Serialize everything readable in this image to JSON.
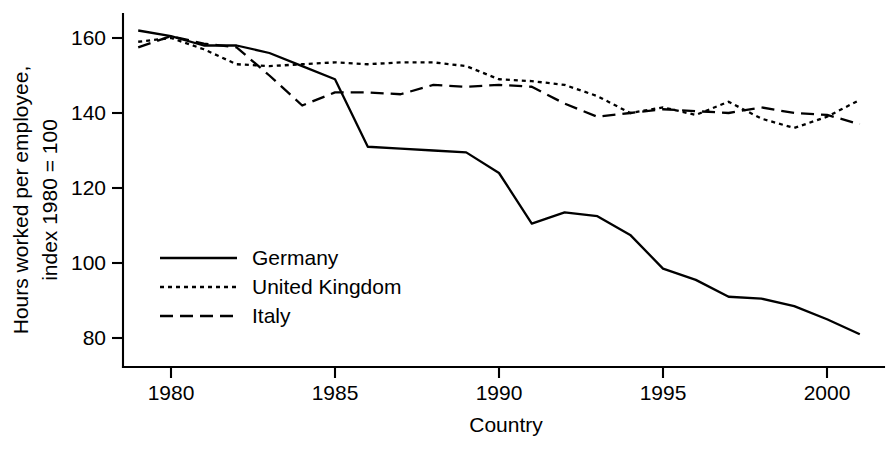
{
  "chart_data": {
    "type": "line",
    "title": "",
    "xlabel": "Country",
    "ylabel": "Hours worked per employee, index 1980 = 100",
    "ylabel_line1": "Hours worked per employee,",
    "ylabel_line2": "index 1980 = 100",
    "xlim": [
      1978.6,
      2001.4
    ],
    "ylim": [
      76,
      166
    ],
    "xticks": [
      1980,
      1985,
      1990,
      1995,
      2000
    ],
    "xtick_labels": [
      "1980",
      "1985",
      "1990",
      "1995",
      "2000"
    ],
    "yticks": [
      80,
      100,
      120,
      140,
      160
    ],
    "ytick_labels": [
      "80",
      "100",
      "120",
      "140",
      "160"
    ],
    "grid": false,
    "legend_position": "center-left",
    "x": [
      1979,
      1980,
      1981,
      1982,
      1983,
      1984,
      1985,
      1986,
      1987,
      1988,
      1989,
      1990,
      1991,
      1992,
      1993,
      1994,
      1995,
      1996,
      1997,
      1998,
      1999,
      2000,
      2001
    ],
    "series": [
      {
        "name": "Germany",
        "style": "solid",
        "color": "#000000",
        "values": [
          162,
          160.5,
          158,
          158,
          156,
          152.5,
          149,
          131,
          130.5,
          130,
          129.5,
          124,
          110.5,
          113.5,
          112.5,
          107.5,
          98.5,
          95.5,
          91,
          90.5,
          88.5,
          85,
          81
        ]
      },
      {
        "name": "United Kingdom",
        "style": "dotted",
        "color": "#000000",
        "values": [
          159,
          160,
          157,
          153,
          152.5,
          153,
          153.5,
          153,
          153.5,
          153.5,
          152.5,
          149,
          148.5,
          147.5,
          144.5,
          140,
          141.5,
          139.5,
          143,
          138.5,
          136,
          139,
          143.5
        ]
      },
      {
        "name": "Italy",
        "style": "dashed",
        "color": "#000000",
        "values": [
          157.5,
          160.5,
          158.5,
          157.5,
          150,
          142,
          145.5,
          145.5,
          145,
          147.5,
          147,
          147.5,
          147,
          142.5,
          139,
          140,
          141,
          140.5,
          140,
          141.5,
          140,
          139.5,
          137
        ]
      }
    ]
  },
  "legend": {
    "items": [
      {
        "label": "Germany"
      },
      {
        "label": "United Kingdom"
      },
      {
        "label": "Italy"
      }
    ]
  }
}
